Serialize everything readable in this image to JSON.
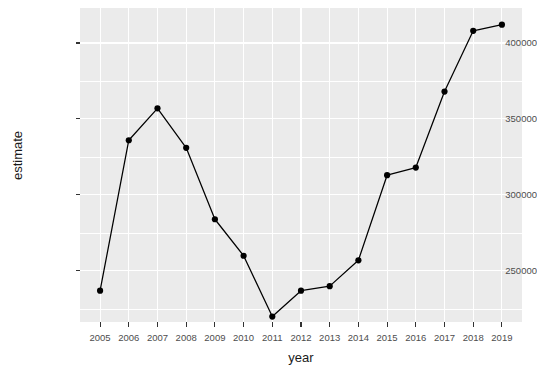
{
  "chart_data": {
    "type": "line",
    "title": "",
    "xlabel": "year",
    "ylabel": "estimate",
    "x": [
      2005,
      2006,
      2007,
      2008,
      2009,
      2010,
      2011,
      2012,
      2013,
      2014,
      2015,
      2016,
      2017,
      2018,
      2019
    ],
    "values": [
      237000,
      336000,
      357000,
      331000,
      284000,
      260000,
      220000,
      237000,
      240000,
      257000,
      313000,
      318000,
      368000,
      408000,
      412000
    ],
    "categories": [
      "2005",
      "2006",
      "2007",
      "2008",
      "2009",
      "2010",
      "2011",
      "2012",
      "2013",
      "2014",
      "2015",
      "2016",
      "2017",
      "2018",
      "2019"
    ],
    "x_tick_labels": [
      "2005",
      "2006",
      "2007",
      "2008",
      "2009",
      "2010",
      "2011",
      "2012",
      "2013",
      "2014",
      "2015",
      "2016",
      "2017",
      "2018",
      "2019"
    ],
    "y_tick_labels": [
      "250000",
      "300000",
      "350000",
      "400000"
    ],
    "y_ticks": [
      250000,
      300000,
      350000,
      400000
    ],
    "y_minor_ticks": [
      225000,
      275000,
      325000,
      375000
    ],
    "xlim": [
      2004.3,
      2019.7
    ],
    "ylim": [
      216400,
      423000
    ],
    "grid": true,
    "legend": null,
    "series": [
      {
        "name": "estimate",
        "values": [
          237000,
          336000,
          357000,
          331000,
          284000,
          260000,
          220000,
          237000,
          240000,
          257000,
          313000,
          318000,
          368000,
          408000,
          412000
        ],
        "color": "#000000",
        "marker": "circle",
        "line_width": 1.2,
        "marker_size": 3.1
      }
    ],
    "panel_background": "#ebebeb",
    "grid_color": "#ffffff",
    "text_color": "#4d4d4d",
    "axis_title_color": "#1a1a1a"
  },
  "axes": {
    "x_title": "year",
    "y_title": "estimate"
  },
  "title": {
    "text": ""
  }
}
